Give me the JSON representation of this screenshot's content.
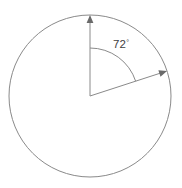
{
  "figure": {
    "type": "geometry-diagram",
    "background_color": "#ffffff",
    "stroke_color": "#8a8a8a",
    "text_color": "#3f3f3f",
    "canvas": {
      "width": 182,
      "height": 188
    },
    "circle": {
      "name": "circle-outline",
      "center_x": 90,
      "center_y": 96,
      "radius": 81,
      "stroke_width": 1
    },
    "center_point": {
      "x": 90,
      "y": 96
    },
    "radii": [
      {
        "name": "radius-vertical",
        "from_x": 90,
        "from_y": 96,
        "to_x": 90,
        "to_y": 15,
        "bearing_degrees": 0,
        "arrowhead": true
      },
      {
        "name": "radius-slanted",
        "from_x": 90,
        "from_y": 96,
        "to_x": 167,
        "to_y": 71,
        "bearing_degrees": 72,
        "arrowhead": true
      }
    ],
    "angle_arc": {
      "name": "angle-arc",
      "radius": 48,
      "start_x": 90,
      "start_y": 48,
      "end_x": 135.7,
      "end_y": 81.2,
      "sweep_degrees": 72
    },
    "angle_label": {
      "value": "72",
      "degree_symbol": "°",
      "full_text": "72°",
      "x": 113,
      "y": 48
    }
  }
}
